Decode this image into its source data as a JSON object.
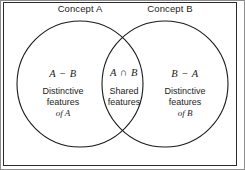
{
  "diagram": {
    "type": "venn-two-set",
    "title_labels": {
      "concept_a": "Concept A",
      "concept_b": "Concept B"
    },
    "regions": [
      {
        "id": "left",
        "expression": "A − B",
        "description_line1": "Distinctive",
        "description_line2": "features",
        "description_line3": "of A"
      },
      {
        "id": "intersection",
        "expression": "A ∩ B",
        "description_line1": "Shared",
        "description_line2": "features"
      },
      {
        "id": "right",
        "expression": "B − A",
        "description_line1": "Distinctive",
        "description_line2": "features",
        "description_line3": "of B"
      }
    ],
    "colors": {
      "stroke": "#1a1a1a",
      "text": "#1c1c1c",
      "background": "#ffffff",
      "frame": "#2b2b2b"
    }
  }
}
